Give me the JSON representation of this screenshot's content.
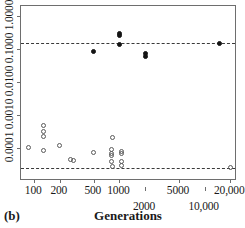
{
  "figure": {
    "panel_label": "(b)",
    "axis_title_x": "Generations"
  },
  "chart_data": {
    "type": "scatter",
    "title": "",
    "subtitle": "",
    "xlabel": "Generations",
    "ylabel": "",
    "xscale": "log",
    "yscale": "log",
    "xlim": [
      70,
      24000
    ],
    "ylim": [
      1e-05,
      2.0
    ],
    "grid": false,
    "legend": "none",
    "annotations": [
      "(b)"
    ],
    "x_tick_labels": [
      "100",
      "200",
      "500",
      "1000",
      "2000",
      "5000",
      "10,000",
      "20,000"
    ],
    "x_tick_values": [
      100,
      200,
      500,
      1000,
      2000,
      5000,
      10000,
      20000
    ],
    "x_tick_rows": [
      1,
      1,
      1,
      1,
      2,
      1,
      2,
      1
    ],
    "y_tick_labels": [
      "0.0001",
      "0.0010",
      "0.0100",
      "0.1000",
      "1.0000"
    ],
    "y_tick_values": [
      0.0001,
      0.001,
      0.01,
      0.1,
      1.0
    ],
    "reference_lines": [
      {
        "name": "upper-threshold",
        "y": 0.15,
        "style": "dashed"
      },
      {
        "name": "lower-threshold",
        "y": 2.5e-05,
        "style": "dashed"
      }
    ],
    "series": [
      {
        "name": "filled-points",
        "marker": "filled-circle",
        "color": "#141414",
        "points": [
          {
            "x": 500,
            "y": 0.082
          },
          {
            "x": 1000,
            "y": 0.3
          },
          {
            "x": 1000,
            "y": 0.255
          },
          {
            "x": 1000,
            "y": 0.135
          },
          {
            "x": 2000,
            "y": 0.072
          },
          {
            "x": 2000,
            "y": 0.06
          },
          {
            "x": 15000,
            "y": 0.145
          }
        ]
      },
      {
        "name": "open-points",
        "marker": "open-circle",
        "color": "#5a5a5a",
        "points": [
          {
            "x": 85,
            "y": 0.000105
          },
          {
            "x": 130,
            "y": 0.00047
          },
          {
            "x": 130,
            "y": 0.00032
          },
          {
            "x": 130,
            "y": 0.00022
          },
          {
            "x": 130,
            "y": 8.2e-05
          },
          {
            "x": 200,
            "y": 0.000115
          },
          {
            "x": 270,
            "y": 4.55e-05
          },
          {
            "x": 290,
            "y": 4.2e-05
          },
          {
            "x": 500,
            "y": 7.2e-05
          },
          {
            "x": 820,
            "y": 0.000205
          },
          {
            "x": 800,
            "y": 8.85e-05
          },
          {
            "x": 800,
            "y": 6.9e-05
          },
          {
            "x": 800,
            "y": 6e-05
          },
          {
            "x": 800,
            "y": 3.95e-05
          },
          {
            "x": 820,
            "y": 2.75e-05
          },
          {
            "x": 1050,
            "y": 8.05e-05
          },
          {
            "x": 1050,
            "y": 6.85e-05
          },
          {
            "x": 1050,
            "y": 3.95e-05
          },
          {
            "x": 1050,
            "y": 3.05e-05
          },
          {
            "x": 20000,
            "y": 2.55e-05
          }
        ]
      }
    ]
  }
}
